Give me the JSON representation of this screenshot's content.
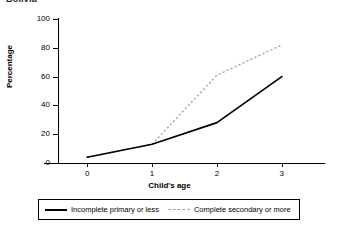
{
  "title": "Bolivia",
  "chart_data": {
    "type": "line",
    "title": "Bolivia",
    "xlabel": "Child's age",
    "ylabel": "Percentage",
    "x": [
      0,
      1,
      2,
      3
    ],
    "xticklabels": [
      "0",
      "1",
      "2",
      "3"
    ],
    "yticks": [
      0,
      20,
      40,
      60,
      80,
      100
    ],
    "yticklabels": [
      "0",
      "20",
      "40",
      "60",
      "80",
      "100"
    ],
    "xlim": [
      -0.45,
      3.45
    ],
    "ylim": [
      0,
      100
    ],
    "grid": false,
    "legend_position": "bottom",
    "series": [
      {
        "name": "Incomplete primary or less",
        "style": "solid",
        "color": "#000000",
        "values": [
          4,
          13,
          28,
          60
        ]
      },
      {
        "name": "Complete secondary or more",
        "style": "dashed",
        "color": "#a8a8a8",
        "values": [
          4,
          13,
          61,
          82
        ]
      }
    ]
  },
  "legend": {
    "entries": [
      {
        "label": "Incomplete primary or less",
        "style": "solid"
      },
      {
        "label": "Complete secondary or more",
        "style": "dashed"
      }
    ]
  }
}
